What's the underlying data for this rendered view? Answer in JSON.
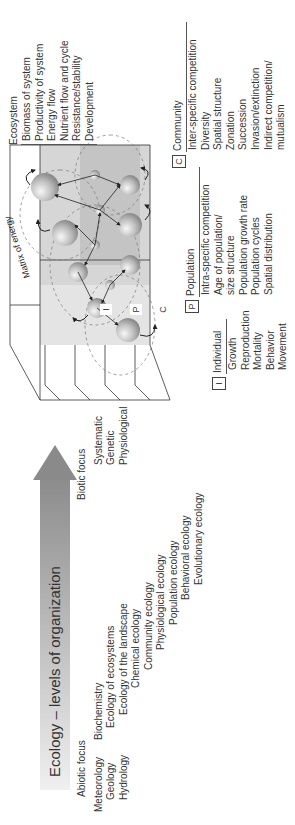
{
  "arrow": {
    "label": "Ecology – levels of organization",
    "gradient_start": "#f0f0f0",
    "gradient_end": "#8a8a8a"
  },
  "abiotic": {
    "heading": "Abiotic focus",
    "items": [
      "Meteorology",
      "Geology",
      "Hydrology"
    ]
  },
  "ecology_fields": [
    "Biochemistry",
    "Ecology of ecosystems",
    "Ecology of the landscape",
    "Chemical ecology",
    "Community ecology",
    "Physiological ecology",
    "Population ecology",
    "Behavioral ecology",
    "Evolutionary ecology"
  ],
  "biotic": {
    "heading": "Biotic focus",
    "items": [
      "Systematic",
      "Genetic",
      "Physiological"
    ]
  },
  "diagram": {
    "matrix_label": "Matrix of energy",
    "level_tags": [
      "I",
      "P",
      "C"
    ],
    "colors": {
      "outer_plane": "#e6e6e6",
      "mid_plane": "#cfcfcf",
      "inner_plane": "#b5b5b5",
      "sphere": "#bcbcbc",
      "lines": "#222222"
    }
  },
  "ecosystem": {
    "heading": "Ecosystem",
    "items": [
      "Biomass of system",
      "Productivity of system",
      "Energy flow",
      "Nutrient flow and cycle",
      "Resistance/stability",
      "Development"
    ]
  },
  "individual": {
    "tag": "I",
    "heading": "Individual",
    "items": [
      "Growth",
      "Reproduction",
      "Mortality",
      "Behavior",
      "Movement"
    ]
  },
  "population": {
    "tag": "P",
    "heading": "Population",
    "items": [
      "Intra-specific competition",
      "Age of population/",
      "size structure",
      "Population growth rate",
      "Population cycles",
      "Spatial distribution"
    ]
  },
  "community": {
    "tag": "C",
    "heading": "Community",
    "items": [
      "Inter-specific competition",
      "Diversity",
      "Spatial structure",
      "Zonation",
      "Succession",
      "Invasion/extinction",
      "Indirect competition/",
      "mutualism"
    ]
  }
}
